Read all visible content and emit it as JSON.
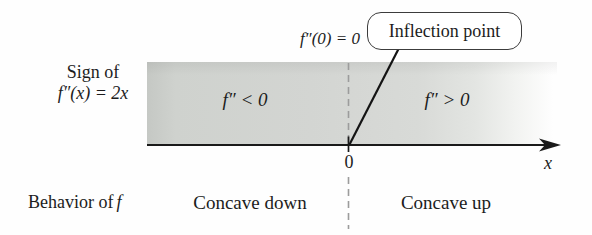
{
  "figure": {
    "sign_label_line1": "Sign of",
    "sign_label_line2": "f″(x) = 2x",
    "annotation_top": "f″(0) = 0",
    "callout_label": "Inflection point",
    "region_negative": "f″ < 0",
    "region_positive": "f″ > 0",
    "origin_label": "0",
    "axis_label": "x",
    "behavior_label_prefix": "Behavior of",
    "behavior_label_f": "f",
    "behavior_negative": "Concave down",
    "behavior_positive": "Concave up"
  },
  "colors": {
    "band_gray_left": "#c5c8c4",
    "band_gray_mid": "#d5d7d4",
    "band_fade_right": "#ffffff",
    "axis_black": "#1a1a1a",
    "dashed_gray": "#9c9c9c",
    "text": "#1c1c1c",
    "callout_border": "#3c3c3c"
  }
}
